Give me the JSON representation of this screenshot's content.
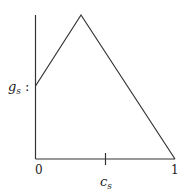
{
  "diagram": {
    "y_label": {
      "main": "g",
      "sub": "s",
      "suffix": " :"
    },
    "x_label": {
      "main": "c",
      "sub": "s"
    },
    "x_ticks": [
      {
        "label": "0"
      },
      {
        "label": "1"
      }
    ],
    "line_color": "#333333"
  }
}
